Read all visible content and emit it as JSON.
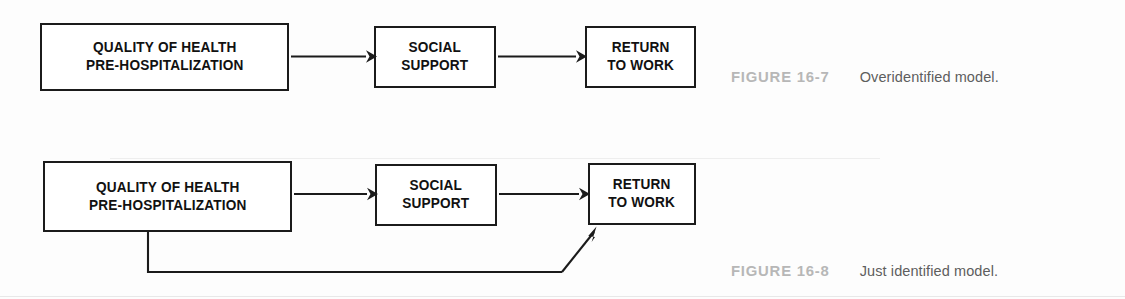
{
  "document": {
    "background_color": "#ffffff",
    "ink_color": "#111111",
    "caption_label_color": "#b7b7b7",
    "caption_text_color": "#5e5e5e"
  },
  "figures": [
    {
      "id": "figure-1",
      "caption_label": "FIGURE 16-7",
      "caption_text": "Overidentified model.",
      "nodes": [
        {
          "id": "quality",
          "label": "QUALITY OF HEALTH\nPRE-HOSPITALIZATION"
        },
        {
          "id": "social",
          "label": "SOCIAL\nSUPPORT"
        },
        {
          "id": "return",
          "label": "RETURN\nTO WORK"
        }
      ],
      "edges": [
        {
          "from": "quality",
          "to": "social",
          "style": "straight"
        },
        {
          "from": "social",
          "to": "return",
          "style": "straight"
        }
      ]
    },
    {
      "id": "figure-2",
      "caption_label": "FIGURE 16-8",
      "caption_text": "Just identified model.",
      "nodes": [
        {
          "id": "quality",
          "label": "QUALITY OF HEALTH\nPRE-HOSPITALIZATION"
        },
        {
          "id": "social",
          "label": "SOCIAL\nSUPPORT"
        },
        {
          "id": "return",
          "label": "RETURN\nTO WORK"
        }
      ],
      "edges": [
        {
          "from": "quality",
          "to": "social",
          "style": "straight"
        },
        {
          "from": "social",
          "to": "return",
          "style": "straight"
        },
        {
          "from": "quality",
          "to": "return",
          "style": "routed-below"
        }
      ]
    }
  ]
}
